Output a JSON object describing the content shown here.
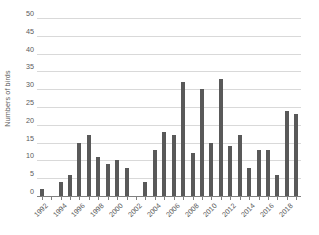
{
  "chart_data": {
    "type": "bar",
    "title": "",
    "xlabel": "",
    "ylabel": "Numbers of birds",
    "ylim": [
      0,
      50
    ],
    "ytick_step": 5,
    "yticks": [
      50,
      45,
      40,
      35,
      30,
      25,
      20,
      15,
      10,
      5,
      0
    ],
    "ytick_labels": [
      "50",
      "45",
      "40",
      "35",
      "30",
      "25",
      "20",
      "15",
      "10",
      "5",
      "0"
    ],
    "grid": "horizontal",
    "legend": "none",
    "bar_color": "#595959",
    "gridline_color": "#d9d9d9",
    "axis_color": "#808080",
    "text_color": "#5a5a5a",
    "xtick_label_rotation": -45,
    "xtick_label_interval": 2,
    "categories": [
      "1992",
      "1993",
      "1994",
      "1995",
      "1996",
      "1997",
      "1998",
      "1999",
      "2000",
      "2001",
      "2002",
      "2003",
      "2004",
      "2005",
      "2006",
      "2007",
      "2008",
      "2009",
      "2010",
      "2011",
      "2012",
      "2013",
      "2014",
      "2015",
      "2016",
      "2017",
      "2018",
      "2019"
    ],
    "values": [
      2,
      0,
      4,
      6,
      15,
      17,
      11,
      9,
      10,
      8,
      0,
      4,
      13,
      18,
      17,
      32,
      12,
      30,
      15,
      33,
      14,
      17,
      8,
      13,
      13,
      6,
      24,
      23
    ],
    "visible_xtick_labels": [
      "1992",
      "1994",
      "1996",
      "1998",
      "2000",
      "2002",
      "2004",
      "2006",
      "2008",
      "2010",
      "2012",
      "2014",
      "2016",
      "2018"
    ]
  }
}
